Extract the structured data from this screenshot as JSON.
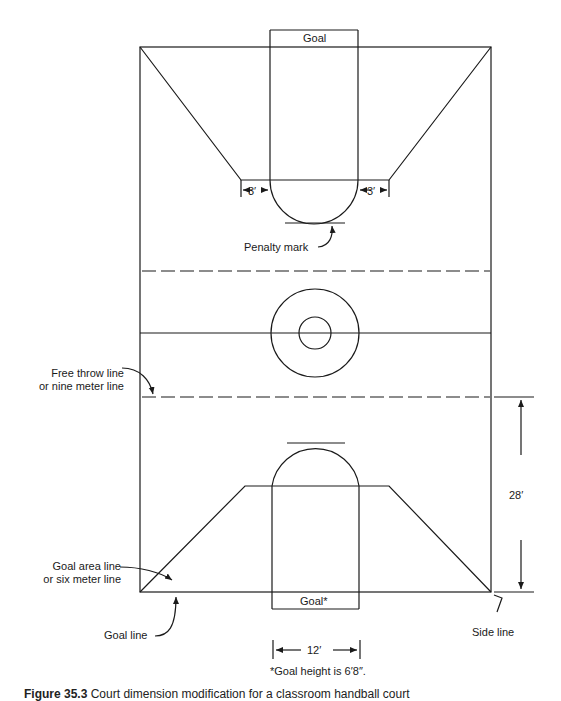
{
  "figure": {
    "caption_number": "Figure 35.3",
    "caption_text": "Court dimension modification for a classroom handball court",
    "footnote": "*Goal height is 6′8″."
  },
  "labels": {
    "top_goal": "Goal",
    "bottom_goal": "Goal*",
    "penalty_mark": "Penalty mark",
    "free_throw_line_1": "Free throw line",
    "free_throw_line_2": "or nine meter line",
    "goal_area_line_1": "Goal area line",
    "goal_area_line_2": "or six meter line",
    "goal_line": "Goal line",
    "side_line": "Side line"
  },
  "dimensions": {
    "left_offset": "3′",
    "right_offset": "3′",
    "goal_width": "12′",
    "free_throw_distance": "28′"
  },
  "colors": {
    "line": "#1a1a1a",
    "background": "#ffffff"
  }
}
